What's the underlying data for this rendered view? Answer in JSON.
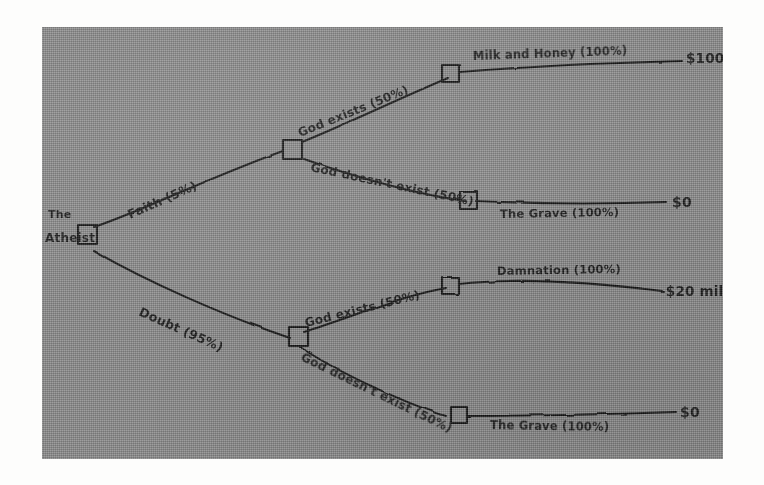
{
  "diagram": {
    "type": "hand-drawn decision tree",
    "root": {
      "label_line1": "The",
      "label_line2": "Atheist",
      "node_type": "decision-square"
    },
    "branches": [
      {
        "id": "faith",
        "label": "Faith (5%)",
        "children": [
          {
            "id": "faith-god-exists",
            "label": "God exists (50%)",
            "outcome_label": "Milk and Honey (100%)",
            "payoff": "$100 million"
          },
          {
            "id": "faith-god-not-exists",
            "label": "God doesn't exist (50%)",
            "outcome_label": "The Grave (100%)",
            "payoff": "$0"
          }
        ]
      },
      {
        "id": "doubt",
        "label": "Doubt (95%)",
        "children": [
          {
            "id": "doubt-god-exists",
            "label": "God exists (50%)",
            "outcome_label": "Damnation (100%)",
            "payoff": "-$20 million"
          },
          {
            "id": "doubt-god-not-exists",
            "label": "God doesn't exist (50%)",
            "outcome_label": "The Grave (100%)",
            "payoff": "$0"
          }
        ]
      }
    ],
    "colors": {
      "paper": "#8d8d8d",
      "ink": "#1d1d1d",
      "page_background": "#fdfdfc"
    }
  }
}
